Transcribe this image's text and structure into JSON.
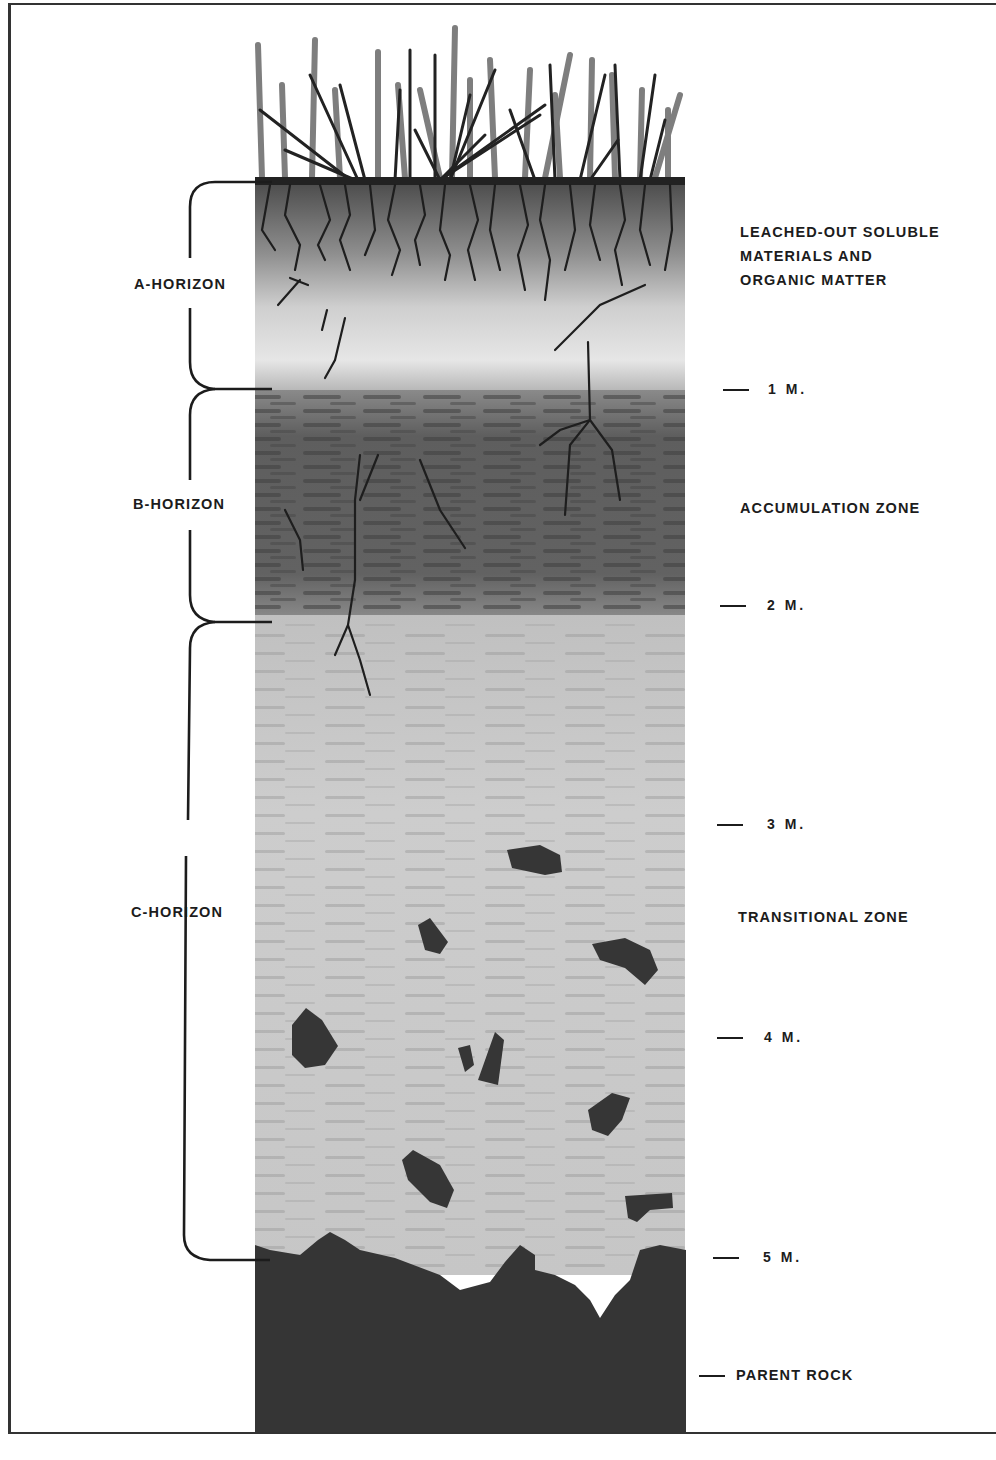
{
  "diagram": {
    "type": "soil-profile",
    "horizons": [
      {
        "id": "a",
        "label": "A-HORIZON",
        "description": "LEACHED-OUT SOLUBLE MATERIALS AND ORGANIC MATTER",
        "description_lines": [
          "LEACHED-OUT SOLUBLE",
          "MATERIALS AND",
          "ORGANIC MATTER"
        ],
        "depth_range_m": [
          0,
          1
        ]
      },
      {
        "id": "b",
        "label": "B-HORIZON",
        "description": "ACCUMULATION ZONE",
        "depth_range_m": [
          1,
          2
        ]
      },
      {
        "id": "c",
        "label": "C-HORIZON",
        "description": "TRANSITIONAL ZONE",
        "depth_range_m": [
          2,
          5
        ]
      }
    ],
    "depth_markers": [
      "1 M.",
      "2 M.",
      "3 M.",
      "4 M.",
      "5 M."
    ],
    "bedrock_label": "PARENT ROCK",
    "colors": {
      "ink": "#1c1c1c",
      "grass_dark": "#2a2a2a",
      "grass_light": "#7a7a7a",
      "a_horizon": "#d6d6d6",
      "b_horizon": "#6e6e6e",
      "c_horizon": "#c8c8c8",
      "rock": "#3a3a3a"
    }
  }
}
